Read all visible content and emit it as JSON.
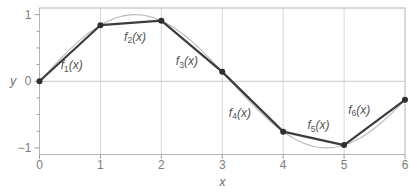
{
  "figure": {
    "width": 410,
    "height": 196,
    "background": "#ffffff",
    "colors": {
      "frame": "#b3b3b3",
      "grid": "#d6d6d6",
      "zero_line": "#c8c8c8",
      "tick": "#9e9e9e",
      "tick_label": "#7d7d7d",
      "axis_label": "#6e6e6e",
      "smooth_curve": "#b9b9b9",
      "interpolant": "#3d3d3d",
      "marker": "#2e2e2e",
      "segment_label": "#555555"
    }
  },
  "chart_data": {
    "type": "line",
    "title": "",
    "xlabel": "x",
    "ylabel": "y",
    "xlim": [
      0,
      6
    ],
    "ylim": [
      -1.1,
      1.1
    ],
    "x_ticks": [
      0,
      1,
      2,
      3,
      4,
      5,
      6
    ],
    "x_tick_labels": [
      "0",
      "1",
      "2",
      "3",
      "4",
      "5",
      "6"
    ],
    "y_major_ticks": [
      -1,
      0,
      1
    ],
    "y_tick_labels": [
      "−1",
      "0",
      "1"
    ],
    "y_minor_ticks": [
      -0.75,
      -0.5,
      -0.25,
      0.25,
      0.5,
      0.75
    ],
    "grid_x": [
      1,
      2,
      3,
      4,
      5
    ],
    "grid_y": [
      0
    ],
    "grid": true,
    "legend_position": "none",
    "series": [
      {
        "name": "smooth-curve",
        "label": "sin(x)",
        "type": "function",
        "fn": "sin",
        "x_range": [
          0,
          6
        ],
        "sample_step": 0.05
      },
      {
        "name": "piecewise-linear-interpolant",
        "type": "polyline",
        "markers": true,
        "x": [
          0,
          1,
          2,
          3,
          4,
          5,
          6
        ],
        "y": [
          0,
          0.8415,
          0.9093,
          0.1411,
          -0.7568,
          -0.9589,
          -0.2794
        ]
      }
    ],
    "segment_label_format": {
      "prefix": "f",
      "suffix": "(x)"
    },
    "segment_labels": [
      {
        "sub": "1",
        "x": 0.53,
        "y": 0.24
      },
      {
        "sub": "2",
        "x": 1.57,
        "y": 0.67
      },
      {
        "sub": "3",
        "x": 2.42,
        "y": 0.3
      },
      {
        "sub": "4",
        "x": 3.29,
        "y": -0.47
      },
      {
        "sub": "5",
        "x": 4.58,
        "y": -0.66
      },
      {
        "sub": "6",
        "x": 5.25,
        "y": -0.43
      }
    ]
  }
}
